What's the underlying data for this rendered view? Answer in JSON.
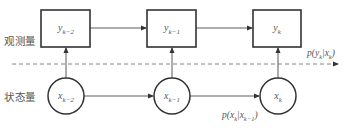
{
  "diagram": {
    "layers": {
      "observation_label": "观测量",
      "state_label": "状态量"
    },
    "observations": [
      {
        "symbol": "y",
        "subscript": "k−2"
      },
      {
        "symbol": "y",
        "subscript": "k−1"
      },
      {
        "symbol": "y",
        "subscript": "k"
      }
    ],
    "states": [
      {
        "symbol": "x",
        "subscript": "k−2"
      },
      {
        "symbol": "x",
        "subscript": "k−1"
      },
      {
        "symbol": "x",
        "subscript": "k"
      }
    ],
    "emission_prob": {
      "prefix": "p(y",
      "sub1": "k",
      "mid": "|x",
      "sub2": "k",
      "suffix": ")"
    },
    "transition_prob": {
      "prefix": "p(x",
      "sub1": "k",
      "mid": "|x",
      "sub2": "k−1",
      "suffix": ")"
    },
    "colors": {
      "stroke": "#333333",
      "text": "#555555",
      "dashed": "#666666"
    }
  }
}
